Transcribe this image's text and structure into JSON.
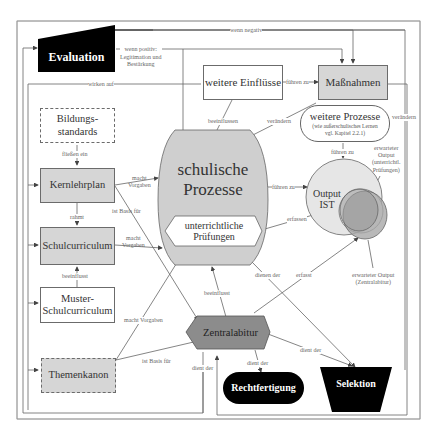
{
  "nodes": {
    "evaluation": "Evaluation",
    "weitere_einfluesse": "weitere Einflüsse",
    "massnahmen": "Maßnahmen",
    "bildungsstandards": "Bildungs-\nstandards",
    "bildungsstandards_l1": "Bildungs-",
    "bildungsstandards_l2": "standards",
    "kernlehrplan": "Kernlehrplan",
    "schulcurriculum": "Schulcurriculum",
    "muster_l1": "Muster-",
    "muster_l2": "Schulcurriculum",
    "themenkanon": "Themenkanon",
    "schulische_l1": "schulische",
    "schulische_l2": "Prozesse",
    "pruefungen_l1": "unterrichtliche",
    "pruefungen_l2": "Prüfungen",
    "weitere_prozesse_l1": "weitere Prozesse",
    "weitere_prozesse_l2": "(wie außerschulisches Lernen",
    "weitere_prozesse_l3": "vgl. Kapitel 2.2.1)",
    "output_l1": "Output",
    "output_l2": "IST",
    "zentralabitur": "Zentralabitur",
    "rechtfertigung": "Rechtfertigung",
    "selektion": "Selektion"
  },
  "edge_labels": {
    "wenn_negativ": "wenn negativ",
    "wenn_positiv_l1": "wenn positiv:",
    "wenn_positiv_l2": "Legitimation und",
    "wenn_positiv_l3": "Bestärkung",
    "wirken_auf": "wirken auf",
    "fuehren_zu_massnahmen": "führen zu",
    "beeinflussen": "beeinflussen",
    "veraendern_left": "verändern",
    "veraendern_right": "verändern",
    "fliessen_ein": "fließen ein",
    "macht_vorgaben_1a": "macht",
    "macht_vorgaben_1b": "Vorgaben",
    "ist_basis_fuer_1": "ist Basis für",
    "rahmt": "rahmt",
    "macht_vorgaben_2a": "macht",
    "macht_vorgaben_2b": "Vorgaben",
    "beeinflusst_1": "beeinflusst",
    "macht_vorgaben_3": "macht Vorgaben",
    "ist_basis_fuer_2": "ist Basis für",
    "fuehren_zu_output": "führen zu",
    "fuehren_zu_wp": "führen zu",
    "erfassen": "erfassen",
    "erwarteter_output_pruef_l1": "erwarteter",
    "erwarteter_output_pruef_l2": "Output",
    "erwarteter_output_pruef_l3": "(unterrichtl.",
    "erwarteter_output_pruef_l4": "Prüfungen)",
    "erwarteter_output_za_l1": "erwarteter Output",
    "erwarteter_output_za_l2": "(Zentralabitur)",
    "dienen_der": "dienen der",
    "erfasst": "erfasst",
    "beeinflusst_2": "beeinflusst",
    "dient_der_1": "dient der",
    "dient_der_2": "dient der",
    "dient_der_3": "dient der"
  },
  "colors": {
    "box_fill": "#d6d6d6",
    "process_fill": "#cfcfcf",
    "zentralabitur_fill": "#8c8c8c",
    "black_fill": "#000000",
    "line": "#555555",
    "output_ist": "#e6e6e6",
    "output_expected": "#a8a8a8"
  }
}
